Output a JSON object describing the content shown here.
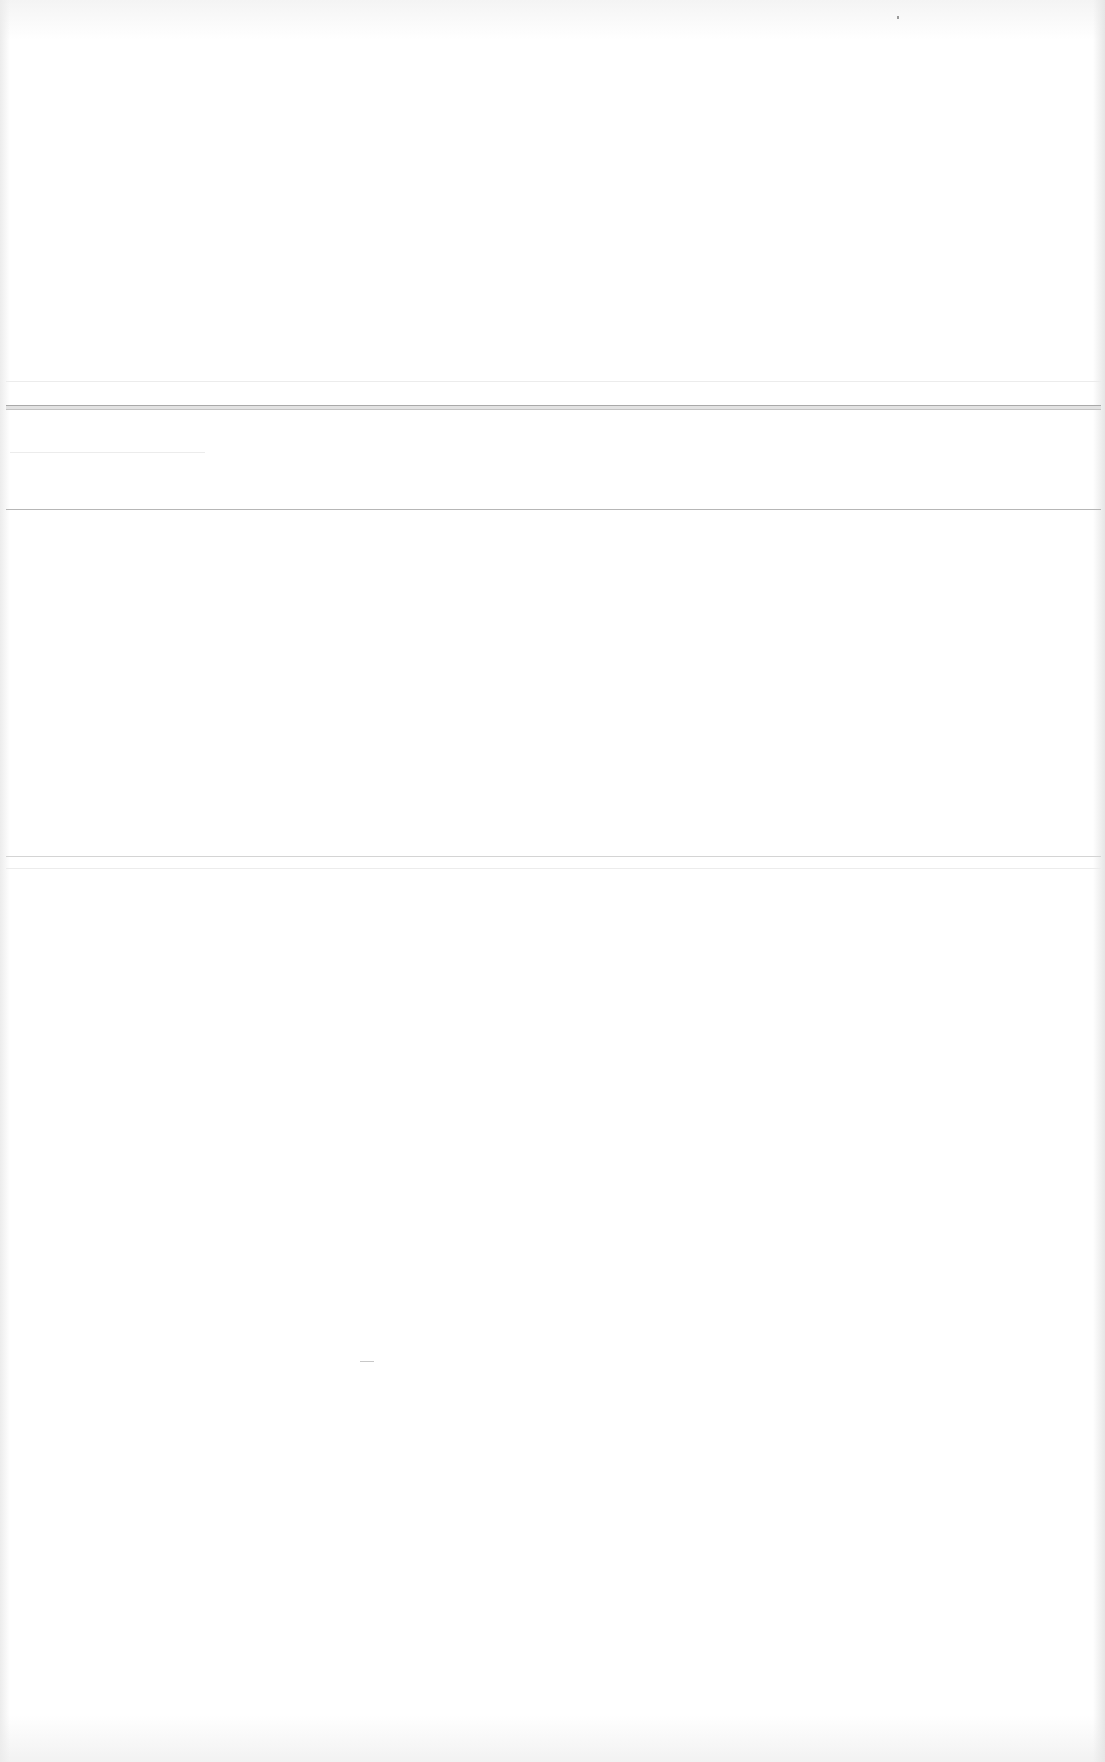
{
  "page": {
    "background_color": "#ffffff",
    "content": "",
    "dividers": [
      {
        "name": "top-faint-rule",
        "y": 381
      },
      {
        "name": "double-rule",
        "y": 406
      },
      {
        "name": "section-rule-1",
        "y": 509
      },
      {
        "name": "section-rule-2",
        "y": 856
      },
      {
        "name": "section-rule-3-faint",
        "y": 868
      }
    ],
    "rule_colors": {
      "double": "#a9a9a9",
      "medium": "#b6b6b6",
      "light": "#d4d4d4"
    }
  }
}
